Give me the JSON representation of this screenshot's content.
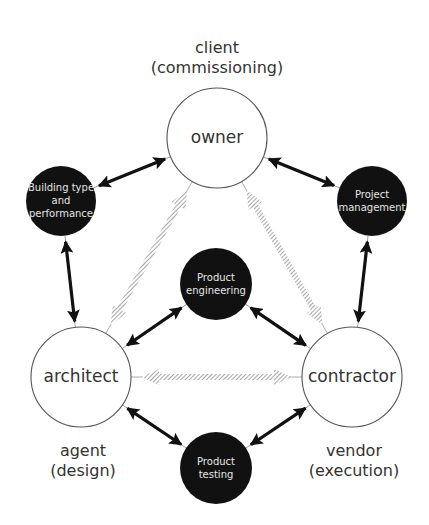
{
  "diagram": {
    "title_labels": {
      "owner_role": [
        "client",
        "(commissioning)"
      ],
      "architect_role": [
        "agent",
        "(design)"
      ],
      "contractor_role": [
        "vendor",
        "(execution)"
      ]
    },
    "primary_nodes": [
      {
        "id": "owner",
        "label": "owner",
        "cx": 217,
        "cy": 138,
        "r": 50
      },
      {
        "id": "architect",
        "label": "architect",
        "cx": 81,
        "cy": 377,
        "r": 50
      },
      {
        "id": "contractor",
        "label": "contractor",
        "cx": 352,
        "cy": 377,
        "r": 50
      }
    ],
    "secondary_nodes": [
      {
        "id": "building-type",
        "lines": [
          "Building type",
          "and",
          "performance"
        ],
        "cx": 61,
        "cy": 201,
        "r": 35
      },
      {
        "id": "project-management",
        "lines": [
          "Project",
          "management"
        ],
        "cx": 372,
        "cy": 201,
        "r": 35
      },
      {
        "id": "product-engineering",
        "lines": [
          "Product",
          "engineering"
        ],
        "cx": 216,
        "cy": 284,
        "r": 36
      },
      {
        "id": "product-testing",
        "lines": [
          "Product",
          "testing"
        ],
        "cx": 216,
        "cy": 468,
        "r": 36
      }
    ],
    "solid_links": [
      {
        "from": "owner",
        "to": "building-type"
      },
      {
        "from": "owner",
        "to": "project-management"
      },
      {
        "from": "building-type",
        "to": "architect"
      },
      {
        "from": "project-management",
        "to": "contractor"
      },
      {
        "from": "architect",
        "to": "product-engineering"
      },
      {
        "from": "contractor",
        "to": "product-engineering"
      },
      {
        "from": "architect",
        "to": "product-testing"
      },
      {
        "from": "contractor",
        "to": "product-testing"
      }
    ],
    "hatched_links": [
      {
        "from": "owner",
        "to": "architect"
      },
      {
        "from": "owner",
        "to": "contractor"
      },
      {
        "from": "architect",
        "to": "contractor"
      }
    ],
    "colors": {
      "dark_node": "#111111",
      "outline": "#555555",
      "text": "#333333",
      "hatch": "#9a9a9a"
    }
  }
}
